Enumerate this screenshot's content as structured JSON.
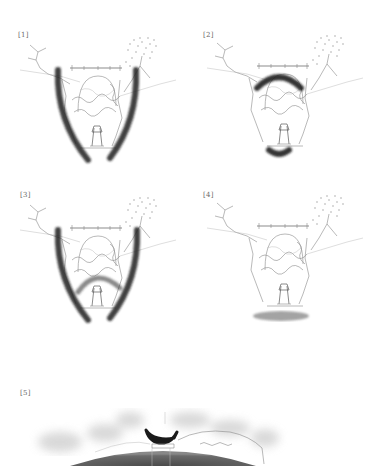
{
  "figure": {
    "panels": [
      {
        "id": "p1",
        "label": "[1]",
        "overlay": "two vertical brush strokes forming a V frame"
      },
      {
        "id": "p3",
        "label": "[3]",
        "overlay": "upper arch stroke and lower small arc stroke"
      },
      {
        "id": "p2",
        "label": "[2]",
        "overlay": "V frame strokes with inner arch stroke"
      },
      {
        "id": "p4",
        "label": "[4]",
        "overlay": "grey ground shadow beneath the scene"
      },
      {
        "id": "p5",
        "label": "[5]",
        "overlay": "large dark dome with boat silhouette on top"
      }
    ],
    "colors": {
      "background": "#ffffff",
      "stroke_dark": "#1e1e1e",
      "sketch_line": "#8a8a8a",
      "ground_shadow": "#9a9a9a",
      "dome": "#5c5c5c"
    }
  }
}
